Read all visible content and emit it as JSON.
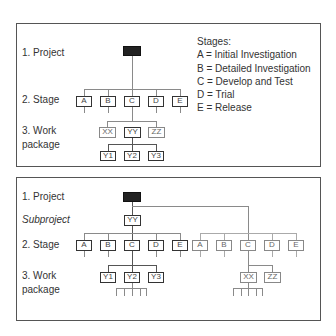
{
  "top_panel": {
    "levels": {
      "project": "1. Project",
      "stage": "2. Stage",
      "work_1": "3. Work",
      "work_2": "package"
    },
    "legend": {
      "title": "Stages:",
      "items": [
        "A = Initial Investigation",
        "B = Detailed Investigation",
        "C = Develop and Test",
        "D = Trial",
        "E = Release"
      ]
    },
    "stages": [
      "A",
      "B",
      "C",
      "D",
      "E"
    ],
    "work_packages": [
      "XX",
      "YY",
      "ZZ"
    ],
    "sub_packages": [
      "Y1",
      "Y2",
      "Y3"
    ]
  },
  "bottom_panel": {
    "levels": {
      "project": "1. Project",
      "subproject": "Subproject",
      "stage": "2. Stage",
      "work_1": "3. Work",
      "work_2": "package"
    },
    "subproject_node": "YY",
    "left_stages": [
      "A",
      "B",
      "C",
      "D",
      "E"
    ],
    "right_stages": [
      "A",
      "B",
      "C",
      "D",
      "E"
    ],
    "left_packages": [
      "Y1",
      "Y2",
      "Y3"
    ],
    "right_packages": [
      "XX",
      "ZZ"
    ]
  }
}
